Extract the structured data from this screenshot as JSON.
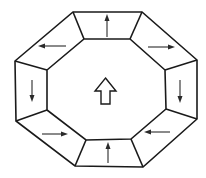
{
  "diagram": {
    "type": "octagonal-frame-flow",
    "colors": {
      "background": "#ffffff",
      "stroke": "#1a1a1a",
      "arrow": "#2a2a2a"
    },
    "outer_octagon": [
      [
        73,
        12
      ],
      [
        142,
        12
      ],
      [
        197,
        60
      ],
      [
        197,
        119
      ],
      [
        143,
        167
      ],
      [
        75,
        166
      ],
      [
        16,
        121
      ],
      [
        15,
        61
      ]
    ],
    "inner_octagon": [
      [
        84,
        39
      ],
      [
        130,
        39
      ],
      [
        165,
        70
      ],
      [
        166,
        109
      ],
      [
        131,
        139
      ],
      [
        86,
        140
      ],
      [
        47,
        110
      ],
      [
        47,
        70
      ]
    ],
    "panels": [
      {
        "id": "top",
        "arrow_direction": "up"
      },
      {
        "id": "upper-right",
        "arrow_direction": "right"
      },
      {
        "id": "right",
        "arrow_direction": "down"
      },
      {
        "id": "lower-right",
        "arrow_direction": "left"
      },
      {
        "id": "bottom",
        "arrow_direction": "up"
      },
      {
        "id": "lower-left",
        "arrow_direction": "right"
      },
      {
        "id": "left",
        "arrow_direction": "down"
      },
      {
        "id": "upper-left",
        "arrow_direction": "left"
      }
    ],
    "center_arrow": {
      "direction": "up",
      "style": "hollow-block-arrow"
    }
  }
}
